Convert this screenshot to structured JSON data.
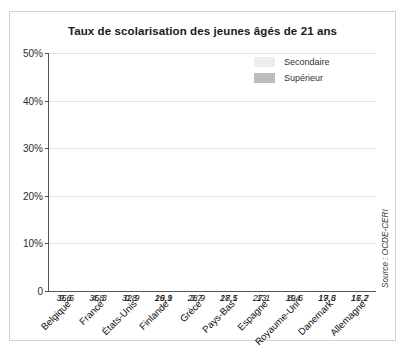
{
  "figure": {
    "title": "Taux de scolarisation des jeunes âgés de 21 ans",
    "source": "Source : OCDE-CERI"
  },
  "legend": {
    "items": [
      {
        "label": "Secondaire",
        "color": "#ededed"
      },
      {
        "label": "Supérieur",
        "color": "#bdbdbd"
      }
    ]
  },
  "yaxis": {
    "ticks": [
      "0",
      "10%",
      "20%",
      "30%",
      "40%",
      "50%"
    ]
  },
  "chart_data": {
    "type": "bar",
    "title": "Taux de scolarisation des jeunes âgés de 21 ans",
    "xlabel": "",
    "ylabel": "",
    "ylim": [
      0,
      50
    ],
    "yticks": [
      0,
      10,
      20,
      30,
      40,
      50
    ],
    "ytick_labels": [
      "0",
      "10%",
      "20%",
      "30%",
      "40%",
      "50%"
    ],
    "grid": true,
    "stacked": true,
    "legend_position": "top-right",
    "categories": [
      "Belgique",
      "France",
      "États-Unis",
      "Finlande",
      "Grèce",
      "Pays-Bas",
      "Espagne",
      "Royaume-Uni",
      "Danemark",
      "Allemagne"
    ],
    "series": [
      {
        "name": "Supérieur",
        "color": "#bdbdbd",
        "values": [
          35.6,
          35.3,
          32.9,
          29.9,
          28.9,
          27.1,
          27.1,
          19.6,
          19.3,
          16.2
        ],
        "labels": [
          "35,6",
          "35,3",
          "32,9",
          "29,9",
          "28,9",
          "27,1",
          "27,1",
          "19,6",
          "19,3",
          "16,2"
        ]
      },
      {
        "name": "Secondaire",
        "color": "#ededed",
        "values": [
          9.6,
          4.8,
          0.8,
          16.1,
          3.7,
          18.5,
          13,
          8.4,
          17.6,
          17.7
        ],
        "labels": [
          "9,6",
          "4,8",
          "0,8",
          "16,1",
          "3,7",
          "18,5",
          "13",
          "8,4",
          "17,6",
          "17,7"
        ]
      }
    ],
    "totals": [
      45.2,
      40.1,
      33.7,
      46.0,
      32.6,
      45.6,
      40.1,
      28.0,
      36.9,
      33.9
    ]
  }
}
